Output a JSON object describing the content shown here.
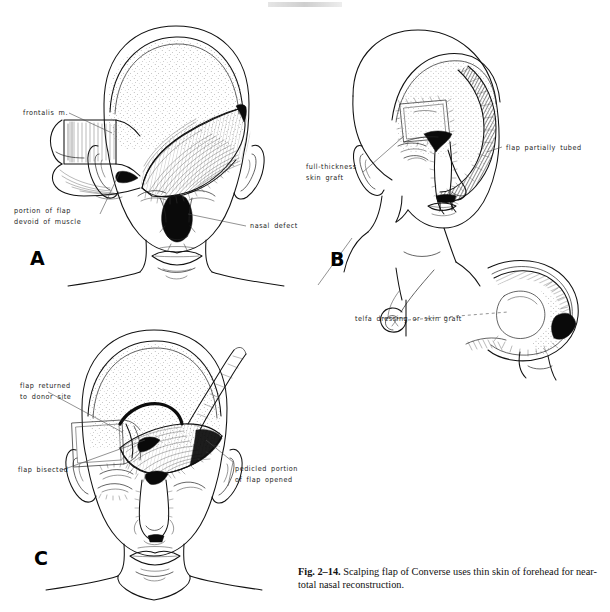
{
  "figure": {
    "caption_label": "Fig. 2–14.",
    "caption_text": " Scalping flap of Converse uses thin skin of forehead for near-total nasal reconstruction."
  },
  "panels": [
    {
      "id": "A",
      "letter": "A",
      "labels": [
        {
          "name": "frontalis-muscle",
          "text": "frontalis m."
        },
        {
          "name": "portion-of-flap-devoid",
          "text": "portion of flap\ndevoid of muscle"
        },
        {
          "name": "nasal-defect",
          "text": "nasal defect"
        }
      ]
    },
    {
      "id": "B",
      "letter": "B",
      "labels": [
        {
          "name": "full-thickness-skin-graft",
          "text": "full-thickness\nskin graft"
        },
        {
          "name": "flap-partially-tubed",
          "text": "flap partially tubed"
        }
      ]
    },
    {
      "id": "inset",
      "letter": "",
      "labels": [
        {
          "name": "telfa-dressing-or-skin-graft",
          "text": "telfa dressing or skin graft"
        }
      ]
    },
    {
      "id": "C",
      "letter": "C",
      "labels": [
        {
          "name": "flap-returned-to-donor-site",
          "text": "flap returned\nto donor site"
        },
        {
          "name": "flap-bisected",
          "text": "flap bisected"
        },
        {
          "name": "pedicled-portion-opened",
          "text": "pedicled portion\nof flap opened"
        }
      ]
    }
  ],
  "colors": {
    "ink": "#111111",
    "paper": "#ffffff",
    "shadow": "#0a0a0a"
  }
}
